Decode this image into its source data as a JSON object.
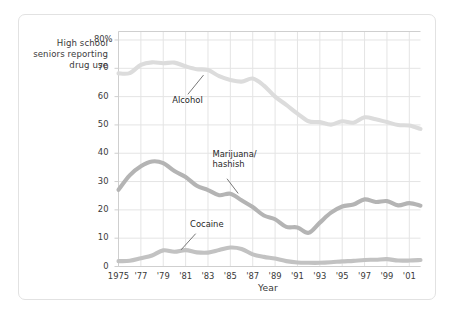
{
  "chart_data": {
    "type": "line",
    "title": "",
    "subtitle": "",
    "ylabel": "High school\nseniors\nreporting\ndrug use",
    "xlabel": "Year",
    "ylim": [
      0,
      83
    ],
    "xlim": [
      1975,
      2002
    ],
    "grid": true,
    "legend_position": "inline-annotations",
    "ytick_labels": [
      "0",
      "10",
      "20",
      "30",
      "40",
      "50",
      "60",
      "70",
      "80%"
    ],
    "ytick_values": [
      0,
      10,
      20,
      30,
      40,
      50,
      60,
      70,
      80
    ],
    "xtick_labels": [
      "1975",
      "'77",
      "'79",
      "'81",
      "'83",
      "'85",
      "'87",
      "'89",
      "'91",
      "'93",
      "'95",
      "'97",
      "'99",
      "'01"
    ],
    "xtick_values": [
      1975,
      1977,
      1979,
      1981,
      1983,
      1985,
      1987,
      1989,
      1991,
      1993,
      1995,
      1997,
      1999,
      2001
    ],
    "x": [
      1975,
      1976,
      1977,
      1978,
      1979,
      1980,
      1981,
      1982,
      1983,
      1984,
      1985,
      1986,
      1987,
      1988,
      1989,
      1990,
      1991,
      1992,
      1993,
      1994,
      1995,
      1996,
      1997,
      1998,
      1999,
      2000,
      2001,
      2002
    ],
    "series": [
      {
        "name": "Alcohol",
        "color": "#dcdcdc",
        "values": [
          68.2,
          68.3,
          71.2,
          72.1,
          71.8,
          72.0,
          70.7,
          69.7,
          69.4,
          67.2,
          65.9,
          65.3,
          66.4,
          63.9,
          60.0,
          57.1,
          54.0,
          51.3,
          51.0,
          50.1,
          51.3,
          50.8,
          52.7,
          52.0,
          51.0,
          50.0,
          49.8,
          48.6
        ]
      },
      {
        "name": "Marijuana/\nhashish",
        "color": "#b4b4b4",
        "values": [
          27.1,
          32.2,
          35.4,
          37.1,
          36.5,
          33.7,
          31.6,
          28.5,
          27.0,
          25.2,
          25.7,
          23.4,
          21.0,
          18.0,
          16.7,
          14.0,
          13.8,
          11.9,
          15.5,
          19.0,
          21.2,
          21.9,
          23.7,
          22.8,
          23.1,
          21.6,
          22.4,
          21.5
        ]
      },
      {
        "name": "Cocaine",
        "color": "#c2c2c2",
        "values": [
          1.9,
          2.0,
          2.9,
          3.9,
          5.7,
          5.2,
          5.8,
          5.0,
          4.9,
          5.8,
          6.7,
          6.2,
          4.3,
          3.4,
          2.8,
          1.9,
          1.4,
          1.3,
          1.3,
          1.5,
          1.8,
          2.0,
          2.3,
          2.4,
          2.6,
          2.1,
          2.1,
          2.3
        ]
      }
    ],
    "annotations": [
      {
        "label": "Alcohol",
        "text_x": 1979.8,
        "text_y": 58.5,
        "leader_from": [
          1981.2,
          60.8
        ],
        "leader_to": [
          1982.6,
          67.6
        ]
      },
      {
        "label": "Marijuana/\nhashish",
        "text_x": 1983.4,
        "text_y": 39.4,
        "leader_from": [
          1984.7,
          31.0
        ],
        "leader_to": [
          1985.7,
          25.8
        ]
      },
      {
        "label": "Cocaine",
        "text_x": 1981.4,
        "text_y": 14.5,
        "leader_from": [
          1981.9,
          11.6
        ],
        "leader_to": [
          1980.6,
          5.9
        ]
      }
    ]
  },
  "style": {
    "grid_color": "#e4e4e4",
    "axis_color": "#cfcfcf",
    "text_color": "#3a3a3a",
    "frame_color": "#e2e2e2",
    "background": "#ffffff"
  }
}
